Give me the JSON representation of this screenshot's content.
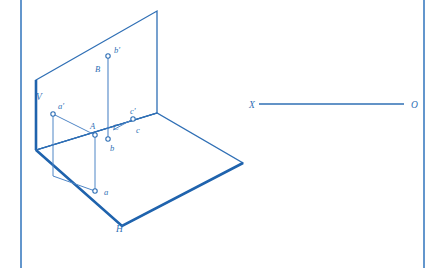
{
  "figure": {
    "colors": {
      "line_primary": "#2f6fb5",
      "line_heavy": "#1f63ad",
      "line_thin": "#4f86c6",
      "border": "#3c7cc0",
      "background": "#ffffff",
      "marker_fill": "#ffffff"
    },
    "border": {
      "left_x": 21,
      "right_x": 424,
      "top_y": 0,
      "bottom_y": 268
    },
    "planes": {
      "vertical_plane": {
        "label": "V",
        "label_x": 36,
        "label_y": 100,
        "points": "36,80 157,11 157,113 36,150"
      },
      "horizontal_plane": {
        "label": "H",
        "label_x": 116,
        "label_y": 232,
        "points": "36,150 157,113 243,163 122,226"
      }
    },
    "points": [
      {
        "name": "a-prime",
        "label": "a'",
        "x": 53,
        "y": 114,
        "label_x": 58,
        "label_y": 109,
        "marker": "open-circle"
      },
      {
        "name": "A",
        "label": "A",
        "x": 95,
        "y": 135,
        "label_x": 90,
        "label_y": 129,
        "marker": "open-circle"
      },
      {
        "name": "a",
        "label": "a",
        "x": 95,
        "y": 191,
        "label_x": 104,
        "label_y": 195,
        "marker": "open-circle"
      },
      {
        "name": "b-prime",
        "label": "b'",
        "x": 108,
        "y": 56,
        "label_x": 114,
        "label_y": 53,
        "marker": "open-circle"
      },
      {
        "name": "B",
        "label": "B",
        "x": 100,
        "y": 62,
        "label_x": 95,
        "label_y": 72,
        "marker": "none"
      },
      {
        "name": "b",
        "label": "b",
        "x": 108,
        "y": 139,
        "label_x": 110,
        "label_y": 151,
        "marker": "open-circle"
      },
      {
        "name": "C",
        "label": "C",
        "x": 113,
        "y": 127,
        "label_x": 113,
        "label_y": 130,
        "marker": "none"
      },
      {
        "name": "c-prime",
        "label": "c'",
        "x": 133,
        "y": 119,
        "label_x": 130,
        "label_y": 114,
        "marker": "open-circle"
      },
      {
        "name": "c",
        "label": "c",
        "x": 133,
        "y": 119,
        "label_x": 136,
        "label_y": 133,
        "marker": "none"
      }
    ],
    "ground_line": {
      "label_start": "X",
      "label_end": "O",
      "start_x": 259,
      "end_x": 404,
      "y": 104,
      "label_start_x": 249,
      "label_start_y": 108,
      "label_end_x": 411,
      "label_end_y": 108
    }
  }
}
